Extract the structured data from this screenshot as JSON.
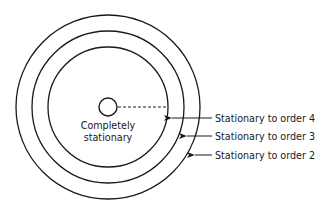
{
  "diagram": {
    "type": "concentric-circles",
    "colors": {
      "stroke": "#1a1a1a",
      "background": "#ffffff"
    },
    "center": {
      "label_line1": "Completely",
      "label_line2": "stationary"
    },
    "rings": [
      {
        "label": "Stationary to order 4",
        "ring": "inner"
      },
      {
        "label": "Stationary to order 3",
        "ring": "middle"
      },
      {
        "label": "Stationary to order 2",
        "ring": "outer"
      }
    ]
  }
}
